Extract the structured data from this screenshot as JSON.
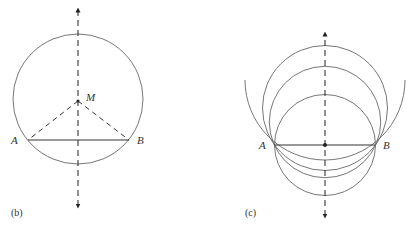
{
  "figures": [
    {
      "id": "b",
      "caption": "(b)",
      "points": {
        "A": "A",
        "B": "B",
        "M": "M"
      },
      "description": "Circle through A and B with center M on the perpendicular bisector; dashed radii MA and MB"
    },
    {
      "id": "c",
      "caption": "(c)",
      "points": {
        "A": "A",
        "B": "B"
      },
      "description": "Family of circles through A and B with centers on the dashed perpendicular bisector"
    }
  ],
  "colors": {
    "line": "#555555",
    "dashed": "#222222",
    "text": "#333333"
  }
}
